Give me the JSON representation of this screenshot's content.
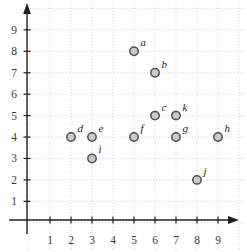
{
  "chart_data": {
    "type": "scatter",
    "title": "",
    "xlabel": "",
    "ylabel": "",
    "xlim": [
      0,
      10
    ],
    "ylim": [
      0,
      10
    ],
    "grid": true,
    "grid_style": "dotted",
    "legend": false,
    "x_ticks": [
      "1",
      "2",
      "3",
      "4",
      "5",
      "6",
      "7",
      "8",
      "9"
    ],
    "y_ticks": [
      "1",
      "2",
      "3",
      "4",
      "5",
      "6",
      "7",
      "8",
      "9"
    ],
    "points": [
      {
        "label": "a",
        "x": 5,
        "y": 8
      },
      {
        "label": "b",
        "x": 6,
        "y": 7
      },
      {
        "label": "c",
        "x": 6,
        "y": 5
      },
      {
        "label": "d",
        "x": 2,
        "y": 4
      },
      {
        "label": "e",
        "x": 3,
        "y": 4
      },
      {
        "label": "f",
        "x": 5,
        "y": 4
      },
      {
        "label": "g",
        "x": 7,
        "y": 4
      },
      {
        "label": "h",
        "x": 9,
        "y": 4
      },
      {
        "label": "i",
        "x": 3,
        "y": 3
      },
      {
        "label": "j",
        "x": 8,
        "y": 2
      },
      {
        "label": "k",
        "x": 7,
        "y": 5
      }
    ],
    "colors": {
      "background": "#ffffff",
      "grid": "#d2d2d2",
      "axis": "#1f1f1f",
      "tick_label": "#3a3a3a",
      "point_fill": "#c9c9c9",
      "point_stroke": "#4e4e4e",
      "point_label": "#1c1c1c"
    }
  }
}
